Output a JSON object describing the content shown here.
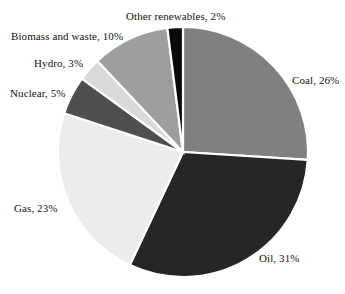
{
  "chart_data": {
    "type": "pie",
    "title": "",
    "subtitle": "",
    "xlabel": "",
    "ylabel": "",
    "legend_position": "none",
    "grid": false,
    "labels_show_percent": true,
    "start_angle_deg": 0,
    "direction": "clockwise",
    "categories": [
      "Coal",
      "Oil",
      "Gas",
      "Nuclear",
      "Hydro",
      "Biomass and waste",
      "Other renewables"
    ],
    "values": [
      26,
      31,
      23,
      5,
      3,
      10,
      2
    ],
    "unit": "%",
    "total": 100,
    "slices": [
      {
        "name": "Coal",
        "value": 26,
        "label": "Coal, 26%",
        "color": "#808080",
        "label_class": "lbl-coal"
      },
      {
        "name": "Oil",
        "value": 31,
        "label": "Oil, 31%",
        "color": "#262626",
        "label_class": "lbl-oil"
      },
      {
        "name": "Gas",
        "value": 23,
        "label": "Gas, 23%",
        "color": "#ececec",
        "label_class": "lbl-gas"
      },
      {
        "name": "Nuclear",
        "value": 5,
        "label": "Nuclear, 5%",
        "color": "#4f4f4f",
        "label_class": "lbl-nuclear"
      },
      {
        "name": "Hydro",
        "value": 3,
        "label": "Hydro, 3%",
        "color": "#d9d9d9",
        "label_class": "lbl-hydro"
      },
      {
        "name": "Biomass and waste",
        "value": 10,
        "label": "Biomass and waste, 10%",
        "color": "#9e9e9e",
        "label_class": "lbl-biomass"
      },
      {
        "name": "Other renewables",
        "value": 2,
        "label": "Other renewables, 2%",
        "color": "#0a0a0a",
        "label_class": "lbl-other"
      }
    ],
    "geometry": {
      "center_x": 183,
      "center_y": 152,
      "radius": 125,
      "separator_color": "#ffffff"
    },
    "background_color": "#ffffff",
    "text_color": "#141414"
  }
}
